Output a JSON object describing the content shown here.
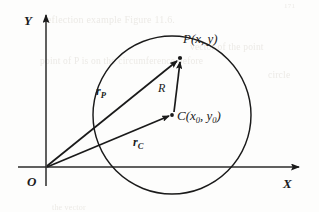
{
  "figure": {
    "kind": "geometry-diagram",
    "background_color": "#fdfdfc",
    "ink_color": "#1a1a1a"
  },
  "axes": {
    "x_label": "X",
    "y_label": "Y",
    "origin_label": "O",
    "x_axis": {
      "x1": 18,
      "y1": 167,
      "x2": 300,
      "y2": 167,
      "arrow": "right"
    },
    "y_axis": {
      "x1": 46,
      "y1": 186,
      "x2": 46,
      "y2": 14,
      "arrow": "up"
    }
  },
  "circle": {
    "center_x": 172,
    "center_y": 115,
    "radius": 79,
    "stroke": "#1a1a1a",
    "stroke_width": 1.4
  },
  "points": [
    {
      "name": "P",
      "label_main": "P",
      "label_args": "(x, y)",
      "x": 180,
      "y": 57,
      "label_x": 184,
      "label_y": 33
    },
    {
      "name": "C",
      "label_main": "C",
      "label_args_pre": "(x",
      "label_args_sub1": "0",
      "label_args_mid": ", y",
      "label_args_sub2": "0",
      "label_args_post": ")",
      "x": 172,
      "y": 115,
      "label_x": 178,
      "label_y": 110
    }
  ],
  "vectors": [
    {
      "name": "r_P",
      "label_main": "r",
      "label_sub": "P",
      "from": "O",
      "to": "P",
      "x1": 47,
      "y1": 166,
      "x2": 177,
      "y2": 60,
      "label_x": 97,
      "label_y": 86
    },
    {
      "name": "r_C",
      "label_main": "r",
      "label_sub": "C",
      "from": "O",
      "to": "C",
      "x1": 47,
      "y1": 167,
      "x2": 169,
      "y2": 117,
      "label_x": 134,
      "label_y": 137
    },
    {
      "name": "R",
      "label_main": "R",
      "label_sub": "",
      "from": "C",
      "to": "P",
      "x1": 173,
      "y1": 112,
      "x2": 180,
      "y2": 61,
      "label_x": 159,
      "label_y": 83
    }
  ],
  "ghost_text": [
    {
      "text": "171",
      "x": 284,
      "y": 2,
      "size": 7
    },
    {
      "text": "leflection example Figure 11.6.",
      "x": 44,
      "y": 14,
      "size": 10
    },
    {
      "text": "point  of  P  is  on  the  circumference  before",
      "x": 40,
      "y": 56,
      "size": 9.5
    },
    {
      "text": "circle",
      "x": 268,
      "y": 70,
      "size": 9.5
    },
    {
      "text": "vector of the point",
      "x": 190,
      "y": 42,
      "size": 9.5
    },
    {
      "text": "the vector",
      "x": 52,
      "y": 205,
      "size": 8
    }
  ]
}
